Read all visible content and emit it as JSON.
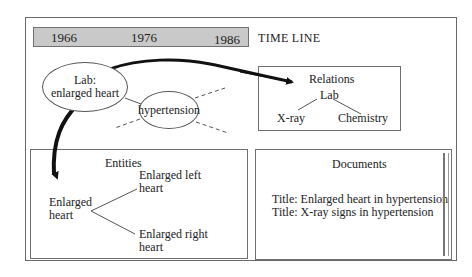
{
  "timeline": {
    "years": [
      "1966",
      "1976",
      "1986"
    ],
    "label": "TIME LINE",
    "bar_color": "#c9c9c9"
  },
  "nodes": {
    "lab_node": {
      "line1": "Lab:",
      "line2": "enlarged heart"
    },
    "hypertension_node": {
      "label": "hypertension"
    }
  },
  "relations": {
    "title": "Relations",
    "root": "Lab",
    "children": [
      "X-ray",
      "Chemistry"
    ]
  },
  "entities": {
    "title": "Entities",
    "root_line1": "Enlarged",
    "root_line2": "heart",
    "children": [
      {
        "line1": "Enlarged left",
        "line2": "heart"
      },
      {
        "line1": "Enlarged right",
        "line2": "heart"
      }
    ]
  },
  "documents": {
    "title": "Documents",
    "items": [
      "Title: Enlarged heart in hypertension",
      "Title: X-ray signs in hypertension"
    ]
  }
}
